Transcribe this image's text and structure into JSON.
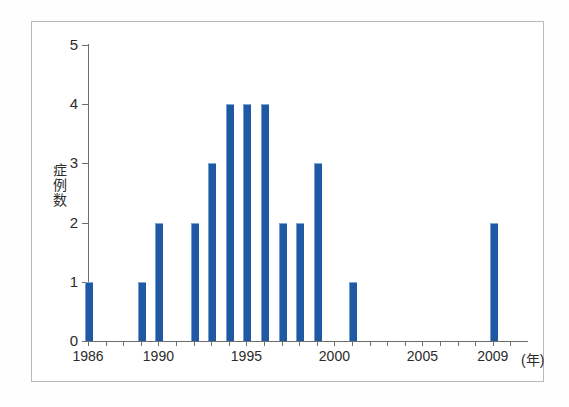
{
  "chart_data": {
    "type": "bar",
    "title": "",
    "subtitle": "",
    "xlabel": "(年)",
    "ylabel": "症例数",
    "ylim": [
      0,
      5
    ],
    "xlim": [
      1986,
      2010
    ],
    "grid": false,
    "legend": null,
    "y_ticks": [
      "0",
      "1",
      "2",
      "3",
      "4",
      "5"
    ],
    "x_tick_labels": [
      "1986",
      "1990",
      "1995",
      "2000",
      "2005",
      "2009"
    ],
    "x_tick_label_years": [
      1986,
      1990,
      1995,
      2000,
      2005,
      2009
    ],
    "bar_color": "#1f59a3",
    "axis_color": "#6d6d6d",
    "frame_color": "#b9b9b9",
    "categories": [
      1986,
      1987,
      1988,
      1989,
      1990,
      1991,
      1992,
      1993,
      1994,
      1995,
      1996,
      1997,
      1998,
      1999,
      2000,
      2001,
      2002,
      2003,
      2004,
      2005,
      2006,
      2007,
      2008,
      2009,
      2010
    ],
    "values": [
      1,
      0,
      0,
      1,
      2,
      0,
      2,
      3,
      4,
      4,
      4,
      2,
      2,
      3,
      0,
      1,
      0,
      0,
      0,
      0,
      0,
      0,
      0,
      2,
      0
    ],
    "bars": [
      {
        "year": 1986,
        "value": 1
      },
      {
        "year": 1989,
        "value": 1
      },
      {
        "year": 1990,
        "value": 2
      },
      {
        "year": 1992,
        "value": 2
      },
      {
        "year": 1993,
        "value": 3
      },
      {
        "year": 1994,
        "value": 4
      },
      {
        "year": 1995,
        "value": 4
      },
      {
        "year": 1996,
        "value": 4
      },
      {
        "year": 1997,
        "value": 2
      },
      {
        "year": 1998,
        "value": 2
      },
      {
        "year": 1999,
        "value": 3
      },
      {
        "year": 2001,
        "value": 1
      },
      {
        "year": 2009,
        "value": 2
      }
    ],
    "ylabel_chars": [
      "症",
      "例",
      "数"
    ]
  }
}
